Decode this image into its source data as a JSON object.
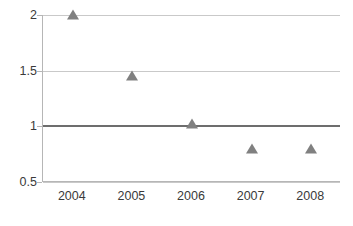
{
  "chart_data": {
    "type": "scatter",
    "title": "",
    "subtitle": "",
    "xlabel": "",
    "ylabel": "",
    "categories": [
      "2004",
      "2005",
      "2006",
      "2007",
      "2008"
    ],
    "x": [
      2004,
      2005,
      2006,
      2007,
      2008
    ],
    "values": [
      2.0,
      1.45,
      1.02,
      0.8,
      0.8
    ],
    "series": [
      {
        "name": "",
        "values": [
          2.0,
          1.45,
          1.02,
          0.8,
          0.8
        ],
        "marker": "triangle",
        "color": "#808080"
      }
    ],
    "ylim": [
      0.5,
      2.0
    ],
    "yticks": [
      0.5,
      1.0,
      1.5,
      2.0
    ],
    "ytick_labels": [
      "0.5",
      "1",
      "1.5",
      "2"
    ],
    "xtick_labels": [
      "2004",
      "2005",
      "2006",
      "2007",
      "2008"
    ],
    "grid": true,
    "grid_axis": "y",
    "legend": false,
    "legend_position": "none",
    "reference_line": {
      "value": 1.0,
      "label": "",
      "color": "#6d6d6d"
    },
    "annotations": []
  },
  "axes": {
    "y_ticks": [
      {
        "label": "2",
        "value": 2.0,
        "emphasis": false
      },
      {
        "label": "1.5",
        "value": 1.5,
        "emphasis": false
      },
      {
        "label": "1",
        "value": 1.0,
        "emphasis": true
      },
      {
        "label": "0.5",
        "value": 0.5,
        "emphasis": false
      }
    ],
    "x_ticks": [
      {
        "label": "2004",
        "value": 2004
      },
      {
        "label": "2005",
        "value": 2005
      },
      {
        "label": "2006",
        "value": 2006
      },
      {
        "label": "2007",
        "value": 2007
      },
      {
        "label": "2008",
        "value": 2008
      }
    ]
  },
  "points": [
    {
      "x_label": "2004",
      "y": 2.0
    },
    {
      "x_label": "2005",
      "y": 1.45
    },
    {
      "x_label": "2006",
      "y": 1.02
    },
    {
      "x_label": "2007",
      "y": 0.8
    },
    {
      "x_label": "2008",
      "y": 0.8
    }
  ],
  "colors": {
    "marker": "#808080",
    "gridline": "#c9c9c9",
    "reference_line": "#6d6d6d",
    "axis": "#b6b6b6",
    "text": "#3a3a3a",
    "background": "#ffffff"
  }
}
